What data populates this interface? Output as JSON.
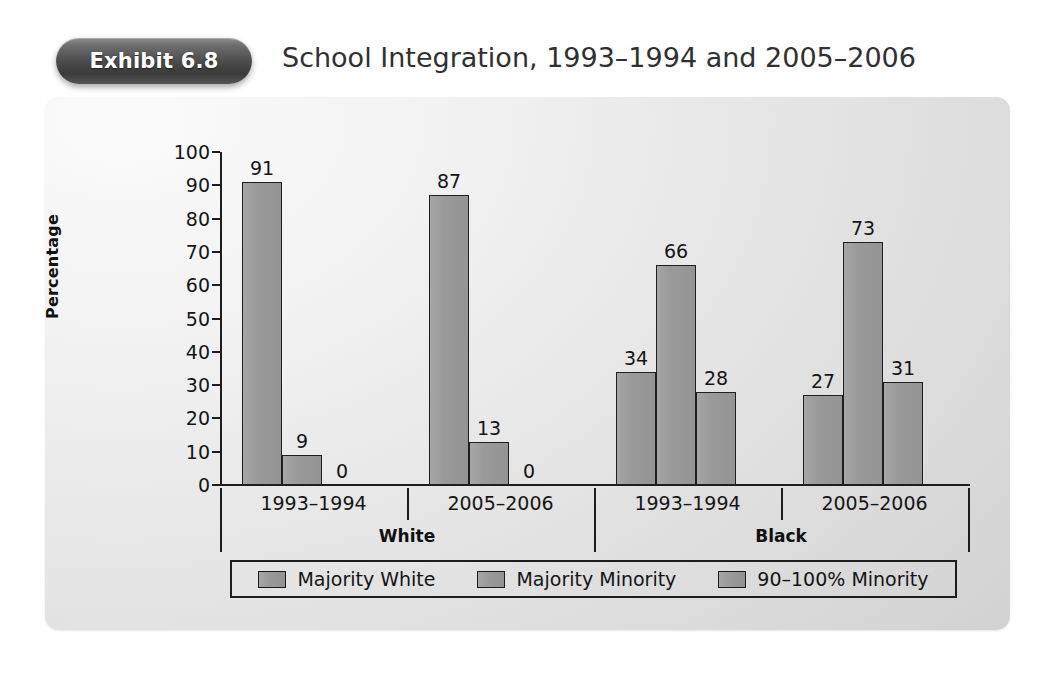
{
  "header": {
    "exhibit_badge": "Exhibit 6.8",
    "title": "School Integration, 1993–1994 and 2005–2006"
  },
  "chart_data": {
    "type": "bar",
    "title": "School Integration, 1993–1994 and 2005–2006",
    "xlabel": "",
    "ylabel": "Percentage",
    "ylim": [
      0,
      100
    ],
    "yticks": [
      0,
      10,
      20,
      30,
      40,
      50,
      60,
      70,
      80,
      90,
      100
    ],
    "ytick_labels": [
      "0",
      "10",
      "20",
      "30",
      "40",
      "50",
      "60",
      "70",
      "80",
      "90",
      "100"
    ],
    "grid": false,
    "legend_position": "bottom",
    "legend": [
      "Majority White",
      "Majority Minority",
      "90–100% Minority"
    ],
    "series": [
      {
        "name": "Majority White",
        "values": [
          91,
          87,
          34,
          27
        ]
      },
      {
        "name": "Majority Minority",
        "values": [
          9,
          13,
          66,
          73
        ]
      },
      {
        "name": "90–100% Minority",
        "values": [
          0,
          0,
          28,
          31
        ]
      }
    ],
    "categories": [
      "1993–1994",
      "2005–2006",
      "1993–1994",
      "2005–2006"
    ],
    "groups": [
      {
        "label": "White",
        "periods": [
          "1993–1994",
          "2005–2006"
        ]
      },
      {
        "label": "Black",
        "periods": [
          "1993–1994",
          "2005–2006"
        ]
      }
    ],
    "bar_labels": [
      [
        "91",
        "9",
        "0"
      ],
      [
        "87",
        "13",
        "0"
      ],
      [
        "34",
        "66",
        "28"
      ],
      [
        "27",
        "73",
        "31"
      ]
    ],
    "colors": {
      "bar_fill": "#9a9a9a",
      "bar_border": "#1f1f1f",
      "axis": "#1d1d1d",
      "panel_background": "#e6e6e6",
      "badge": "#4b4b4b",
      "text": "#141414"
    }
  }
}
